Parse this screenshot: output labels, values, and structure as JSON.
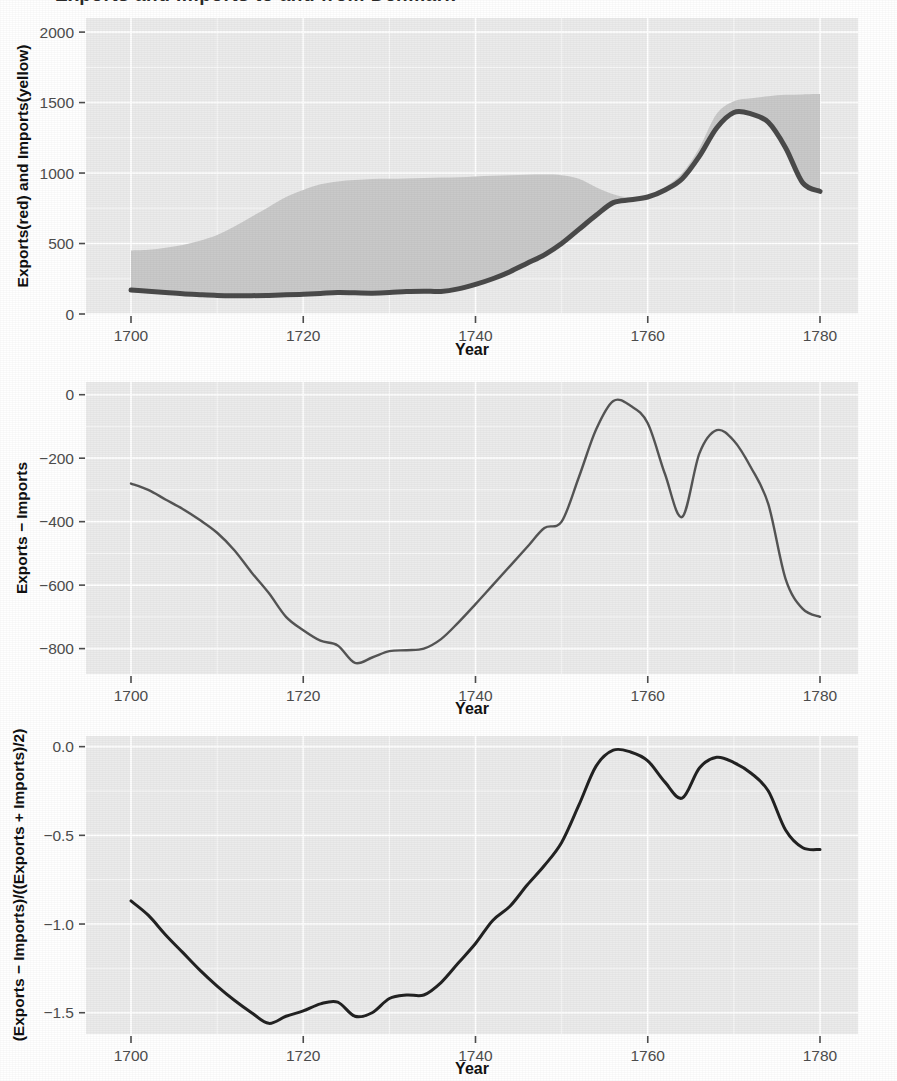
{
  "figure": {
    "background_color": "#ffffff",
    "panel_background_color": "#ebebeb",
    "gridline_color": "#ffffff",
    "axis_text_color": "#4d4d4d",
    "axis_title_color": "#111111",
    "ribbon_fill_color": "#c9c9c9",
    "line_color": "#4a4a4a",
    "top_clipped_text": "Exports and Imports to and from Denmark"
  },
  "chart_data": [
    {
      "id": "panel-exports-imports",
      "type": "area",
      "title": "",
      "xlabel": "Year",
      "ylabel": "Exports(red) and Imports(yellow)",
      "xlim": [
        1700,
        1780
      ],
      "ylim": [
        0,
        2100
      ],
      "xticks": [
        1700,
        1720,
        1740,
        1760,
        1780
      ],
      "xticklabels": [
        "1700",
        "1720",
        "1740",
        "1760",
        "1780"
      ],
      "yticks": [
        0,
        500,
        1000,
        1500,
        2000
      ],
      "yticklabels": [
        "0",
        "500",
        "1000",
        "1500",
        "2000"
      ],
      "grid": true,
      "legend": "none",
      "x": [
        1700,
        1702,
        1704,
        1706,
        1708,
        1710,
        1712,
        1714,
        1716,
        1718,
        1720,
        1722,
        1724,
        1726,
        1728,
        1730,
        1732,
        1734,
        1736,
        1738,
        1740,
        1742,
        1744,
        1746,
        1748,
        1750,
        1752,
        1754,
        1756,
        1758,
        1760,
        1762,
        1764,
        1766,
        1768,
        1770,
        1772,
        1774,
        1776,
        1778,
        1780
      ],
      "series": [
        {
          "name": "Exports (red)",
          "color": "#4a4a4a",
          "values": [
            170,
            162,
            152,
            143,
            137,
            132,
            130,
            130,
            132,
            136,
            140,
            146,
            152,
            150,
            148,
            152,
            160,
            162,
            160,
            178,
            210,
            250,
            300,
            360,
            420,
            500,
            600,
            700,
            790,
            810,
            830,
            880,
            960,
            1120,
            1320,
            1430,
            1420,
            1360,
            1180,
            930,
            870
          ]
        },
        {
          "name": "Imports (yellow)",
          "color": "#c9c9c9",
          "values": [
            450,
            455,
            470,
            490,
            520,
            560,
            620,
            690,
            760,
            830,
            880,
            920,
            940,
            950,
            958,
            960,
            962,
            965,
            968,
            970,
            975,
            980,
            985,
            988,
            990,
            985,
            960,
            900,
            850,
            825,
            838,
            900,
            1000,
            1180,
            1420,
            1510,
            1530,
            1545,
            1555,
            1558,
            1560
          ]
        }
      ]
    },
    {
      "id": "panel-trade-balance",
      "type": "line",
      "title": "",
      "xlabel": "Year",
      "ylabel": "Exports − Imports",
      "xlim": [
        1700,
        1780
      ],
      "ylim": [
        -880,
        40
      ],
      "xticks": [
        1700,
        1720,
        1740,
        1760,
        1780
      ],
      "xticklabels": [
        "1700",
        "1720",
        "1740",
        "1760",
        "1780"
      ],
      "yticks": [
        0,
        -200,
        -400,
        -600,
        -800
      ],
      "yticklabels": [
        "0",
        "−200",
        "−400",
        "−600",
        "−800"
      ],
      "grid": true,
      "legend": "none",
      "x": [
        1700,
        1702,
        1704,
        1706,
        1708,
        1710,
        1712,
        1714,
        1716,
        1718,
        1720,
        1722,
        1724,
        1726,
        1728,
        1730,
        1732,
        1734,
        1736,
        1738,
        1740,
        1742,
        1744,
        1746,
        1748,
        1750,
        1752,
        1754,
        1756,
        1758,
        1760,
        1762,
        1764,
        1766,
        1768,
        1770,
        1772,
        1774,
        1776,
        1778,
        1780
      ],
      "series": [
        {
          "name": "Exports − Imports",
          "color": "#555555",
          "values": [
            -280,
            -300,
            -330,
            -360,
            -395,
            -435,
            -490,
            -560,
            -625,
            -700,
            -742,
            -775,
            -790,
            -845,
            -828,
            -808,
            -805,
            -800,
            -770,
            -718,
            -660,
            -600,
            -540,
            -480,
            -420,
            -400,
            -260,
            -110,
            -20,
            -35,
            -90,
            -250,
            -385,
            -185,
            -112,
            -145,
            -230,
            -345,
            -580,
            -675,
            -700
          ]
        }
      ]
    },
    {
      "id": "panel-relative-balance",
      "type": "line",
      "title": "",
      "xlabel": "Year",
      "ylabel": "(Exports − Imports)/((Exports + Imports)/2)",
      "xlim": [
        1700,
        1780
      ],
      "ylim": [
        -1.62,
        0.06
      ],
      "xticks": [
        1700,
        1720,
        1740,
        1760,
        1780
      ],
      "xticklabels": [
        "1700",
        "1720",
        "1740",
        "1760",
        "1780"
      ],
      "yticks": [
        0.0,
        -0.5,
        -1.0,
        -1.5
      ],
      "yticklabels": [
        "0.0",
        "−0.5",
        "−1.0",
        "−1.5"
      ],
      "grid": true,
      "legend": "none",
      "x": [
        1700,
        1702,
        1704,
        1706,
        1708,
        1710,
        1712,
        1714,
        1716,
        1718,
        1720,
        1722,
        1724,
        1726,
        1728,
        1730,
        1732,
        1734,
        1736,
        1738,
        1740,
        1742,
        1744,
        1746,
        1748,
        1750,
        1752,
        1754,
        1756,
        1758,
        1760,
        1762,
        1764,
        1766,
        1768,
        1770,
        1772,
        1774,
        1776,
        1778,
        1780
      ],
      "series": [
        {
          "name": "(Exports − Imports)/((Exports + Imports)/2)",
          "color": "#222222",
          "values": [
            -0.87,
            -0.95,
            -1.06,
            -1.16,
            -1.26,
            -1.35,
            -1.43,
            -1.5,
            -1.56,
            -1.52,
            -1.49,
            -1.45,
            -1.44,
            -1.52,
            -1.5,
            -1.42,
            -1.4,
            -1.4,
            -1.33,
            -1.22,
            -1.11,
            -0.98,
            -0.9,
            -0.78,
            -0.67,
            -0.54,
            -0.33,
            -0.11,
            -0.02,
            -0.03,
            -0.08,
            -0.2,
            -0.29,
            -0.12,
            -0.06,
            -0.09,
            -0.15,
            -0.25,
            -0.47,
            -0.57,
            -0.58
          ]
        }
      ]
    }
  ]
}
